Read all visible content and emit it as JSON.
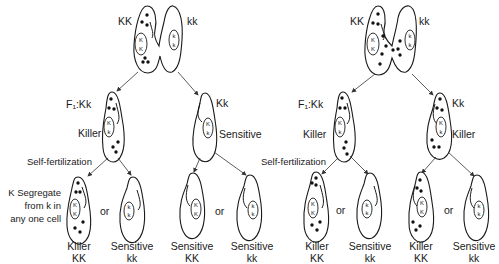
{
  "left_panel": {
    "parents": {
      "left_genotype": "KK",
      "right_genotype": "kk",
      "left_nucleus": [
        "K",
        "K"
      ],
      "right_nucleus": [
        "k",
        "k"
      ]
    },
    "f1_left": {
      "label": "F₁:Kk",
      "phenotype": "Killer",
      "nucleus": [
        "K",
        "k"
      ]
    },
    "f1_right": {
      "label": "Kk",
      "phenotype": "Sensitive",
      "nucleus": [
        "K",
        "k"
      ]
    },
    "process_label": "Self-fertilization",
    "note_lines": [
      "K Segregate",
      "from k in",
      "any one cell"
    ],
    "or_label": "or",
    "offspring": [
      {
        "phenotype": "Killer",
        "genotype": "KK",
        "nucleus": [
          "K",
          "K"
        ]
      },
      {
        "phenotype": "Sensitive",
        "genotype": "kk",
        "nucleus": [
          "k",
          "k"
        ]
      },
      {
        "phenotype": "Sensitive",
        "genotype": "KK",
        "nucleus": [
          "K",
          "K"
        ]
      },
      {
        "phenotype": "Sensitive",
        "genotype": "kk",
        "nucleus": [
          "k",
          "k"
        ]
      }
    ]
  },
  "right_panel": {
    "parents": {
      "left_genotype": "KK",
      "right_genotype": "kk",
      "left_nucleus": [
        "K",
        "K"
      ],
      "right_nucleus": [
        "k",
        "k"
      ]
    },
    "f1_left": {
      "label": "F₁:Kk",
      "phenotype": "Killer",
      "nucleus": [
        "K",
        "k"
      ]
    },
    "f1_right": {
      "label": "Kk",
      "phenotype": "Killer",
      "nucleus": [
        "K",
        "k"
      ]
    },
    "process_label": "Self-fertilization",
    "or_label": "or",
    "offspring": [
      {
        "phenotype": "Killer",
        "genotype": "KK",
        "nucleus": [
          "K",
          "K"
        ]
      },
      {
        "phenotype": "Sensitive",
        "genotype": "kk",
        "nucleus": [
          "k",
          "k"
        ]
      },
      {
        "phenotype": "Killer",
        "genotype": "KK",
        "nucleus": [
          "K",
          "K"
        ]
      },
      {
        "phenotype": "Sensitive",
        "genotype": "kk",
        "nucleus": [
          "k",
          "k"
        ]
      }
    ]
  }
}
